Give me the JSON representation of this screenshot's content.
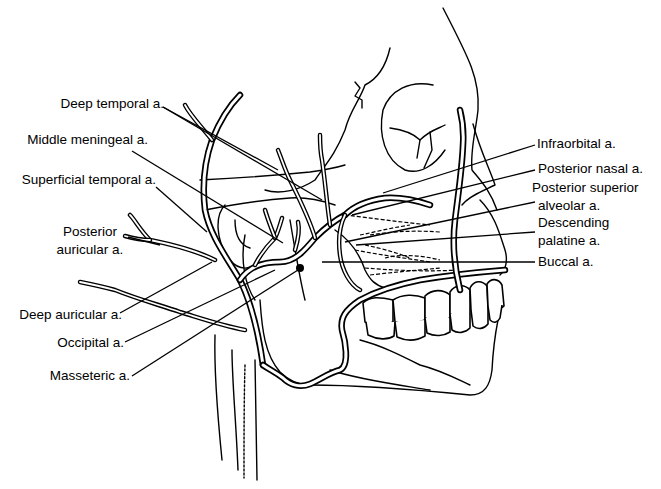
{
  "figure": {
    "colors": {
      "line": "#000000",
      "background": "#ffffff"
    }
  },
  "labels": {
    "left": [
      {
        "id": "deep-temporal",
        "text": "Deep temporal a."
      },
      {
        "id": "middle-meningeal",
        "text": "Middle meningeal a."
      },
      {
        "id": "superficial-temporal",
        "text": "Superficial temporal a."
      },
      {
        "id": "posterior-auricular-1",
        "text": "Posterior"
      },
      {
        "id": "posterior-auricular-2",
        "text": "auricular a."
      },
      {
        "id": "deep-auricular",
        "text": "Deep auricular a."
      },
      {
        "id": "occipital",
        "text": "Occipital a."
      },
      {
        "id": "masseteric",
        "text": "Masseteric a."
      }
    ],
    "right": [
      {
        "id": "infraorbital",
        "text": "Infraorbital a."
      },
      {
        "id": "posterior-nasal",
        "text": "Posterior nasal a."
      },
      {
        "id": "posterior-superior-alveolar-1",
        "text": "Posterior superior"
      },
      {
        "id": "posterior-superior-alveolar-2",
        "text": "alveolar a."
      },
      {
        "id": "descending-palatine-1",
        "text": "Descending"
      },
      {
        "id": "descending-palatine-2",
        "text": "palatine a."
      },
      {
        "id": "buccal",
        "text": "Buccal a."
      }
    ]
  }
}
